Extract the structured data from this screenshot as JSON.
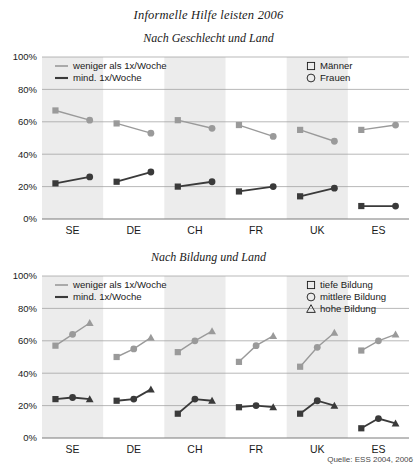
{
  "title": "Informelle Hilfe leisten 2006",
  "source": "Quelle: ESS 2004, 2006",
  "axis": {
    "yticks": [
      "0%",
      "20%",
      "40%",
      "60%",
      "80%",
      "100%"
    ],
    "categories": [
      "SE",
      "DE",
      "CH",
      "FR",
      "UK",
      "ES"
    ]
  },
  "legend_common": {
    "low_label": "weniger als 1x/Woche",
    "high_label": "mind. 1x/Woche"
  },
  "panels": {
    "gender": {
      "title": "Nach Geschlecht und Land",
      "legend_groups": [
        {
          "label": "Männer",
          "shape": "square"
        },
        {
          "label": "Frauen",
          "shape": "circle"
        }
      ]
    },
    "education": {
      "title": "Nach Bildung und Land",
      "legend_groups": [
        {
          "label": "tiefe Bildung",
          "shape": "square"
        },
        {
          "label": "mittlere Bildung",
          "shape": "circle"
        },
        {
          "label": "hohe Bildung",
          "shape": "triangle"
        }
      ]
    }
  },
  "chart_data": [
    {
      "type": "line",
      "title": "Nach Geschlecht und Land",
      "xlabel": "",
      "ylabel": "",
      "ylim": [
        0,
        100
      ],
      "yticks": [
        0,
        20,
        40,
        60,
        80,
        100
      ],
      "grid": true,
      "legend_position": "top",
      "categories": [
        "SE",
        "DE",
        "CH",
        "FR",
        "UK",
        "ES"
      ],
      "groups": [
        "Männer",
        "Frauen"
      ],
      "series": [
        {
          "name": "weniger als 1x/Woche",
          "color": "#9a9a9a",
          "values": {
            "Männer": [
              67,
              59,
              61,
              58,
              55,
              55
            ],
            "Frauen": [
              61,
              53,
              56,
              51,
              48,
              58
            ]
          }
        },
        {
          "name": "mind. 1x/Woche",
          "color": "#3a3a3a",
          "values": {
            "Männer": [
              22,
              23,
              20,
              17,
              14,
              8
            ],
            "Frauen": [
              26,
              29,
              23,
              20,
              19,
              8
            ]
          }
        }
      ]
    },
    {
      "type": "line",
      "title": "Nach Bildung und Land",
      "xlabel": "",
      "ylabel": "",
      "ylim": [
        0,
        100
      ],
      "yticks": [
        0,
        20,
        40,
        60,
        80,
        100
      ],
      "grid": true,
      "legend_position": "top",
      "categories": [
        "SE",
        "DE",
        "CH",
        "FR",
        "UK",
        "ES"
      ],
      "groups": [
        "tiefe Bildung",
        "mittlere Bildung",
        "hohe Bildung"
      ],
      "series": [
        {
          "name": "weniger als 1x/Woche",
          "color": "#9a9a9a",
          "values": {
            "tiefe Bildung": [
              57,
              50,
              53,
              47,
              44,
              54
            ],
            "mittlere Bildung": [
              64,
              55,
              60,
              57,
              56,
              60
            ],
            "hohe Bildung": [
              71,
              62,
              66,
              63,
              65,
              64
            ]
          }
        },
        {
          "name": "mind. 1x/Woche",
          "color": "#3a3a3a",
          "values": {
            "tiefe Bildung": [
              24,
              23,
              15,
              19,
              15,
              6
            ],
            "mittlere Bildung": [
              25,
              24,
              24,
              20,
              23,
              12
            ],
            "hohe Bildung": [
              24,
              30,
              23,
              19,
              20,
              9
            ]
          }
        }
      ]
    }
  ]
}
